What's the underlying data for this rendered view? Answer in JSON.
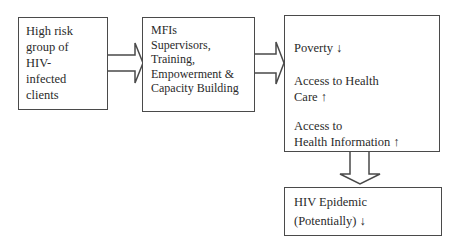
{
  "diagram": {
    "type": "flowchart",
    "nodes": [
      {
        "id": "clients",
        "lines": [
          "High risk",
          "group of",
          "HIV-",
          "infected",
          "clients"
        ]
      },
      {
        "id": "mfi",
        "lines": [
          "MFIs",
          "Supervisors,",
          "Training,",
          "Empowerment &",
          "Capacity Building"
        ]
      },
      {
        "id": "outcomes",
        "items": [
          {
            "lines": [
              "Poverty ↓"
            ]
          },
          {
            "lines": [
              "Access to Health",
              "Care ↑"
            ]
          },
          {
            "lines": [
              "Access to",
              "Health Information ↑"
            ]
          }
        ]
      },
      {
        "id": "epidemic",
        "lines": [
          "HIV Epidemic",
          "(Potentially) ↓"
        ]
      }
    ],
    "edges": [
      {
        "from": "clients",
        "to": "mfi",
        "direction": "right"
      },
      {
        "from": "mfi",
        "to": "outcomes",
        "direction": "right"
      },
      {
        "from": "outcomes",
        "to": "epidemic",
        "direction": "down"
      }
    ],
    "colors": {
      "stroke": "#4a4a4a",
      "text": "#2a2a2a",
      "background": "#ffffff"
    }
  }
}
